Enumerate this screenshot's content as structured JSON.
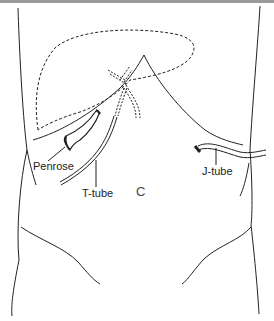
{
  "figure": {
    "type": "anatomical line drawing",
    "labels": {
      "penrose": "Penrose",
      "t_tube": "T-tube",
      "j_tube": "J-tube",
      "navel": "C"
    },
    "colors": {
      "line": "#222222",
      "background": "#ffffff",
      "top_bar": "#9a9a9a"
    }
  }
}
